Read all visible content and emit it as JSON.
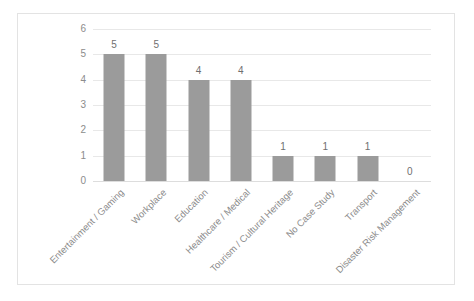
{
  "chart_data": {
    "type": "bar",
    "title": "",
    "subtitle": "",
    "xlabel": "",
    "ylabel": "",
    "categories": [
      "Entertainment / Gaming",
      "Workplace",
      "Education",
      "Healthcare / Medical",
      "Tourism / Cultural Heritage",
      "No Case Study",
      "Transport",
      "Disaster Risk Management"
    ],
    "values": [
      5,
      5,
      4,
      4,
      1,
      1,
      1,
      0
    ],
    "data_labels": [
      "5",
      "5",
      "4",
      "4",
      "1",
      "1",
      "1",
      "0"
    ],
    "ylim": [
      0,
      6
    ],
    "ytick_labels": [
      "0",
      "1",
      "2",
      "3",
      "4",
      "5",
      "6"
    ],
    "ytick_values": [
      0,
      1,
      2,
      3,
      4,
      5,
      6
    ],
    "grid": true,
    "grid_axis": "y",
    "legend": false,
    "legend_position": "none",
    "xtick_rotation_deg": -45,
    "colors": {
      "bar": "#9b9b9b",
      "gridline": "#e8e8e8",
      "baseline": "#dddddd",
      "tick_label": "#8c8c8c",
      "data_label": "#6f6f6f",
      "border": "#e3e3e3",
      "background": "#ffffff"
    }
  }
}
